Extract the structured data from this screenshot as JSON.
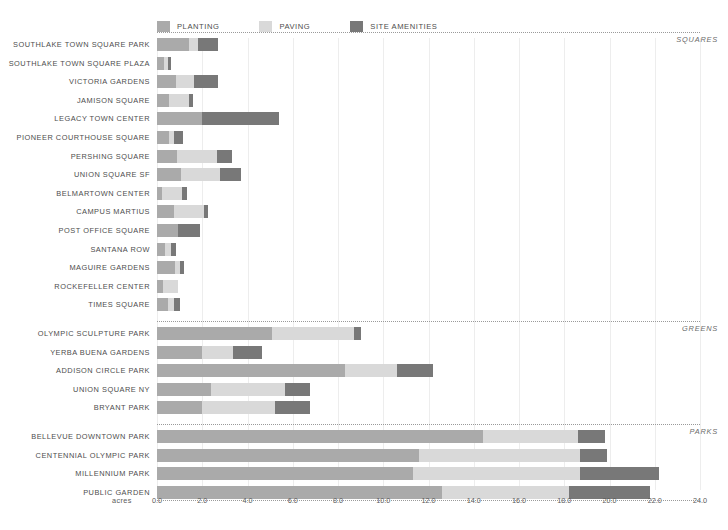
{
  "legend": {
    "items": [
      {
        "label": "PLANTING",
        "color": "#aaaaaa",
        "key": "planting"
      },
      {
        "label": "PAVING",
        "color": "#d9d9d9",
        "key": "paving"
      },
      {
        "label": "SITE AMENITIES",
        "color": "#787878",
        "key": "amenities"
      }
    ]
  },
  "axis": {
    "unit_label": "acres",
    "ticks": [
      "0.0",
      "2.0",
      "4.0",
      "6.0",
      "8.0",
      "10.0",
      "12.0",
      "14.0",
      "16.0",
      "18.0",
      "20.0",
      "22.0",
      "24.0"
    ]
  },
  "sections": [
    {
      "title": "SQUARES"
    },
    {
      "title": "GREENS"
    },
    {
      "title": "PARKS"
    }
  ],
  "chart_data": {
    "type": "bar",
    "orientation": "horizontal",
    "stacked": true,
    "title": "",
    "xlabel": "acres",
    "ylabel": "",
    "xlim": [
      0,
      24
    ],
    "xticks": [
      0,
      2,
      4,
      6,
      8,
      10,
      12,
      14,
      16,
      18,
      20,
      22,
      24
    ],
    "grid": true,
    "legend_position": "top-left",
    "series": [
      {
        "name": "PLANTING",
        "color": "#aaaaaa"
      },
      {
        "name": "PAVING",
        "color": "#d9d9d9"
      },
      {
        "name": "SITE AMENITIES",
        "color": "#787878"
      }
    ],
    "groups": [
      {
        "name": "SQUARES",
        "categories": [
          "SOUTHLAKE TOWN SQUARE PARK",
          "SOUTHLAKE TOWN SQUARE PLAZA",
          "VICTORIA GARDENS",
          "JAMISON SQUARE",
          "LEGACY TOWN CENTER",
          "PIONEER COURTHOUSE SQUARE",
          "PERSHING SQUARE",
          "UNION SQUARE SF",
          "BELMARTOWN CENTER",
          "CAMPUS MARTIUS",
          "POST OFFICE SQUARE",
          "SANTANA ROW",
          "MAGUIRE GARDENS",
          "ROCKEFELLER CENTER",
          "TIMES SQUARE"
        ],
        "values": {
          "planting": [
            1.4,
            0.3,
            0.85,
            0.55,
            2.0,
            0.55,
            0.9,
            1.05,
            0.22,
            0.73,
            0.95,
            0.35,
            0.78,
            0.25,
            0.5
          ],
          "paving": [
            0.4,
            0.17,
            0.78,
            0.87,
            0.0,
            0.22,
            1.75,
            1.75,
            0.9,
            1.33,
            0.0,
            0.25,
            0.22,
            0.7,
            0.25
          ],
          "amenities": [
            0.88,
            0.15,
            1.05,
            0.18,
            3.4,
            0.38,
            0.65,
            0.92,
            0.2,
            0.2,
            0.95,
            0.22,
            0.18,
            0.0,
            0.25
          ]
        }
      },
      {
        "name": "GREENS",
        "categories": [
          "OLYMPIC SCULPTURE PARK",
          "YERBA BUENA GARDENS",
          "ADDISON CIRCLE PARK",
          "UNION SQUARE NY",
          "BRYANT PARK"
        ],
        "values": {
          "planting": [
            5.1,
            2.0,
            8.3,
            2.4,
            2.0
          ],
          "paving": [
            3.6,
            1.35,
            2.3,
            3.25,
            3.2
          ],
          "amenities": [
            0.3,
            1.3,
            1.6,
            1.1,
            1.55
          ]
        }
      },
      {
        "name": "PARKS",
        "categories": [
          "BELLEVUE DOWNTOWN PARK",
          "CENTENNIAL OLYMPIC PARK",
          "MILLENNIUM PARK",
          "PUBLIC GARDEN"
        ],
        "values": {
          "planting": [
            14.4,
            11.6,
            11.3,
            12.6
          ],
          "paving": [
            4.2,
            7.1,
            7.4,
            5.6
          ],
          "amenities": [
            1.2,
            1.2,
            3.5,
            3.6
          ]
        }
      }
    ]
  }
}
